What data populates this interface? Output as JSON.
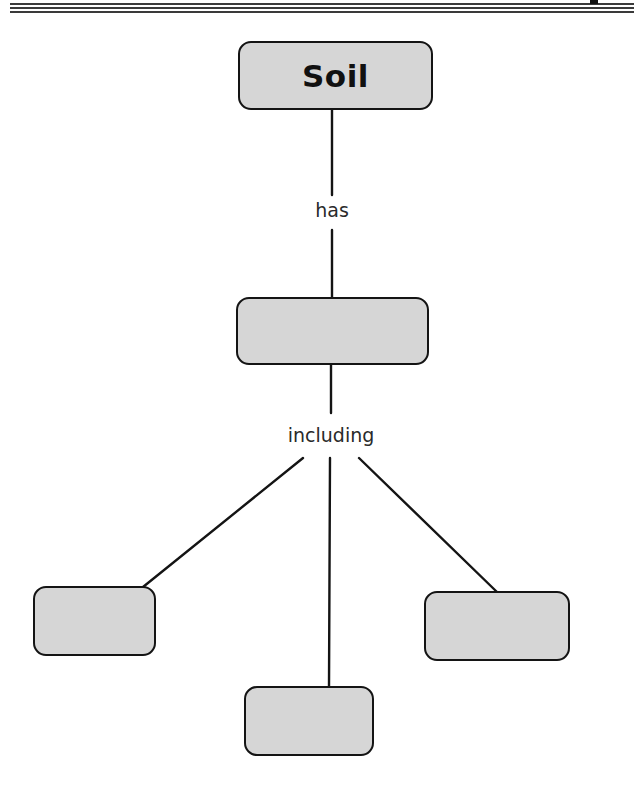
{
  "diagram": {
    "type": "concept-map",
    "root": {
      "id": "soil",
      "label": "Soil"
    },
    "links": [
      {
        "from": "soil",
        "to": "level2",
        "label": "has"
      },
      {
        "from": "level2",
        "to": [
          "leaf-left",
          "leaf-center",
          "leaf-right"
        ],
        "label": "including"
      }
    ],
    "nodes": [
      {
        "id": "soil",
        "label": "Soil"
      },
      {
        "id": "level2",
        "label": ""
      },
      {
        "id": "leaf-left",
        "label": ""
      },
      {
        "id": "leaf-center",
        "label": ""
      },
      {
        "id": "leaf-right",
        "label": ""
      }
    ],
    "link_labels": {
      "has": "has",
      "including": "including"
    }
  },
  "colors": {
    "node_fill": "#d6d6d6",
    "node_border": "#141414",
    "line": "#141414",
    "background": "#ffffff"
  }
}
